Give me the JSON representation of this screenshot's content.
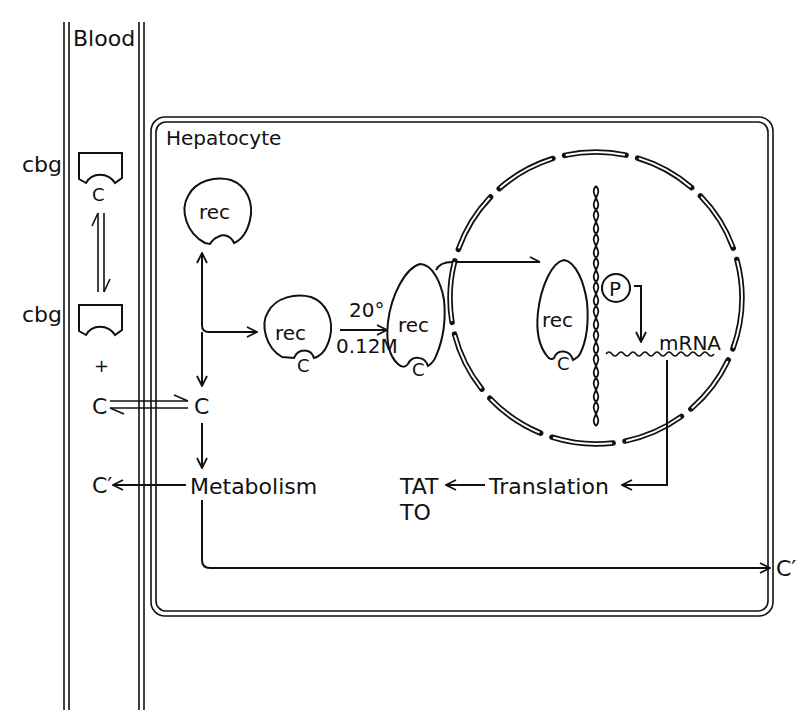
{
  "compartments": {
    "blood": "Blood",
    "cell": "Hepatocyte"
  },
  "blood_side": {
    "cbg_top_label": "cbg",
    "cbg_top_bound": "C",
    "cbg_bottom_label": "cbg",
    "plus": "+",
    "free_cortisol": "C",
    "metabolite": "C′"
  },
  "cytoplasm": {
    "receptor_free": "rec",
    "cortisol_in_cell": "C",
    "receptor_bound": "rec",
    "receptor_bound_ligand": "C",
    "activation_temp": "20°",
    "activation_salt": "0.12M",
    "receptor_activated": "rec",
    "receptor_activated_ligand": "C",
    "metabolism": "Metabolism",
    "metabolite_out": "C′"
  },
  "nucleus": {
    "receptor_dna_bound": "rec",
    "receptor_dna_ligand": "C",
    "promoter": "P",
    "mrna": "mRNA"
  },
  "translation": {
    "label": "Translation",
    "product_1": "TAT",
    "product_2": "TO"
  },
  "colors": {
    "ink": "#111111",
    "background": "#ffffff"
  }
}
